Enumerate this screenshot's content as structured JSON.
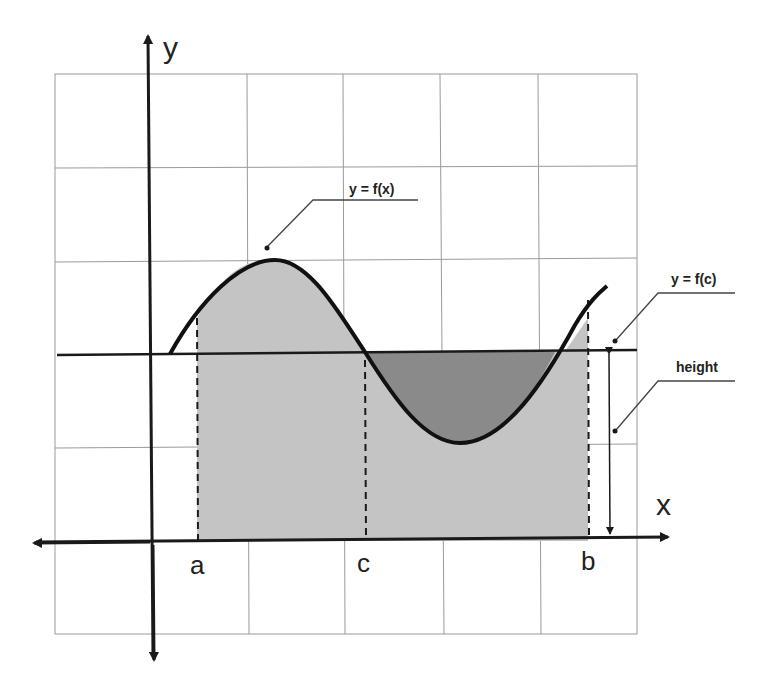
{
  "diagram": {
    "axes": {
      "x_label": "x",
      "y_label": "y"
    },
    "points": {
      "a": "a",
      "b": "b",
      "c": "c"
    },
    "callouts": {
      "function": "y = f(x)",
      "mean_value": "y = f(c)",
      "height": "height"
    },
    "colors": {
      "grid": "#9a9a9a",
      "axis": "#1a1a1a",
      "curve": "#111111",
      "area_fill": "#c4c4c4",
      "excess_fill": "#8a8a8a"
    }
  }
}
